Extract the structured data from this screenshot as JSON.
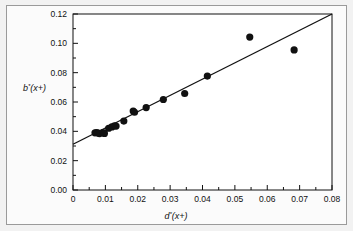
{
  "figure": {
    "background_color": "#f2f2f2",
    "panel_color": "#fbfbfb",
    "border_color": "#9a9a9a",
    "line_color": "#111111",
    "marker_color": "#111111"
  },
  "chart_data": {
    "type": "scatter",
    "title": "",
    "xlabel": "d*(x+)",
    "xlabel_base": "d",
    "xlabel_star": "*",
    "xlabel_arg": "(x+)",
    "ylabel": "b*(x+)",
    "ylabel_base": "b",
    "ylabel_star": "*",
    "ylabel_arg": "(x+)",
    "xlim": [
      0,
      0.08
    ],
    "ylim": [
      0.0,
      0.12
    ],
    "xticks": [
      0,
      0.01,
      0.02,
      0.03,
      0.04,
      0.05,
      0.06,
      0.07,
      0.08
    ],
    "xtick_labels": [
      "0",
      "0.01",
      "0.02",
      "0.03",
      "0.04",
      "0.05",
      "0.06",
      "0.07",
      "0.08"
    ],
    "yticks": [
      0.0,
      0.02,
      0.04,
      0.06,
      0.08,
      0.1,
      0.12
    ],
    "ytick_labels": [
      "0.00",
      "0.02",
      "0.04",
      "0.06",
      "0.08",
      "0.10",
      "0.12"
    ],
    "xminor_step": 0.005,
    "yminor_step": 0.01,
    "grid": false,
    "legend": null,
    "marker": "filled-circle",
    "marker_size_px": 3.6,
    "points": [
      {
        "x": 0.0068,
        "y": 0.039
      },
      {
        "x": 0.0073,
        "y": 0.0392
      },
      {
        "x": 0.0078,
        "y": 0.0388
      },
      {
        "x": 0.0082,
        "y": 0.0385
      },
      {
        "x": 0.0092,
        "y": 0.0392
      },
      {
        "x": 0.0097,
        "y": 0.0386
      },
      {
        "x": 0.011,
        "y": 0.0421
      },
      {
        "x": 0.012,
        "y": 0.043
      },
      {
        "x": 0.0128,
        "y": 0.0438
      },
      {
        "x": 0.0133,
        "y": 0.0436
      },
      {
        "x": 0.0157,
        "y": 0.047
      },
      {
        "x": 0.0186,
        "y": 0.0538
      },
      {
        "x": 0.019,
        "y": 0.053
      },
      {
        "x": 0.0226,
        "y": 0.0562
      },
      {
        "x": 0.0279,
        "y": 0.0617
      },
      {
        "x": 0.0345,
        "y": 0.0658
      },
      {
        "x": 0.0415,
        "y": 0.0777
      },
      {
        "x": 0.0546,
        "y": 0.1043
      },
      {
        "x": 0.0683,
        "y": 0.0955
      }
    ],
    "fit_line": {
      "type": "linear",
      "intercept": 0.0312,
      "slope": 1.108,
      "x_start": 0.0,
      "y_start": 0.0312,
      "x_end": 0.08,
      "y_end": 0.12
    }
  }
}
